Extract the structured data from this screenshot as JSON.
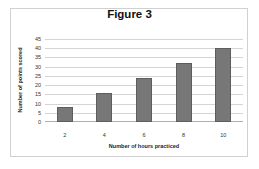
{
  "chart_data": {
    "type": "bar",
    "title": "Figure 3",
    "xlabel": "Number of hours practiced",
    "ylabel": "Number of points scored",
    "categories": [
      "2",
      "4",
      "6",
      "8",
      "10"
    ],
    "values": [
      8,
      16,
      24,
      32,
      40
    ],
    "ylim": [
      0,
      45
    ],
    "yticks": [
      "0",
      "5",
      "10",
      "15",
      "20",
      "25",
      "30",
      "35",
      "40",
      "45"
    ],
    "grid": true,
    "legend": "none",
    "bar_color": "#777777"
  }
}
